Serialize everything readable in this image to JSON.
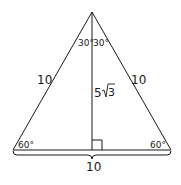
{
  "diagram": {
    "type": "equilateral-triangle-with-altitude",
    "stroke_color": "#1a1a1a",
    "labels": {
      "left_side": "10",
      "right_side": "10",
      "base": "10",
      "altitude": "5",
      "altitude_radicand": "3",
      "apex_left_angle": "30°",
      "apex_right_angle": "30°",
      "base_left_angle": "60°",
      "base_right_angle": "60°"
    }
  }
}
